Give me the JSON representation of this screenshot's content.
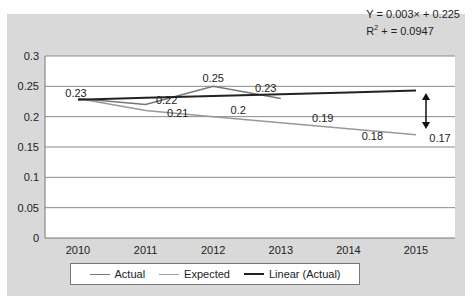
{
  "chart_data": {
    "type": "line",
    "title": "",
    "xlabel": "",
    "ylabel": "",
    "categories": [
      "2010",
      "2011",
      "2012",
      "2013",
      "2014",
      "2015"
    ],
    "yticks": [
      "0",
      "0.05",
      "0.1",
      "0.15",
      "0.2",
      "0.25",
      "0.3"
    ],
    "ylim": [
      0,
      0.3
    ],
    "grid": true,
    "legend_position": "bottom",
    "series": [
      {
        "name": "Actual",
        "color": "#777777",
        "values": [
          0.23,
          0.22,
          0.25,
          0.23,
          null,
          null
        ]
      },
      {
        "name": "Expected",
        "color": "#999999",
        "values": [
          0.23,
          0.21,
          0.2,
          0.19,
          0.18,
          0.17
        ]
      },
      {
        "name": "Linear (Actual)",
        "color": "#222222",
        "values": [
          0.228,
          0.231,
          0.234,
          0.237,
          0.24,
          0.243
        ]
      }
    ],
    "data_labels": [
      {
        "text": "0.23",
        "x": "2010",
        "series": "Actual/Expected"
      },
      {
        "text": "0.22",
        "x": "2011",
        "series": "Actual"
      },
      {
        "text": "0.25",
        "x": "2012",
        "series": "Actual"
      },
      {
        "text": "0.23",
        "x": "2013",
        "series": "Actual"
      },
      {
        "text": "0.21",
        "x": "2011",
        "series": "Expected"
      },
      {
        "text": "0.2",
        "x": "2012",
        "series": "Expected"
      },
      {
        "text": "0.19",
        "x": "2013",
        "series": "Expected"
      },
      {
        "text": "0.18",
        "x": "2014",
        "series": "Expected"
      },
      {
        "text": "0.17",
        "x": "2015",
        "series": "Expected"
      }
    ],
    "annotations": [
      {
        "type": "equation",
        "text": "Y = 0.003x + 0.225"
      },
      {
        "type": "r-squared",
        "text": "R² + = 0.0947"
      },
      {
        "type": "double-arrow",
        "x": "2015",
        "from": 0.243,
        "to": 0.17,
        "meaning": "gap between trend and expected"
      }
    ]
  },
  "equation": {
    "line1": "Y = 0.003× + 0.225",
    "r2_prefix": "R",
    "r2_sup": "2",
    "r2_rest": " + = 0.0947"
  },
  "legend": {
    "items": [
      "Actual",
      "Expected",
      "Linear (Actual)"
    ]
  }
}
